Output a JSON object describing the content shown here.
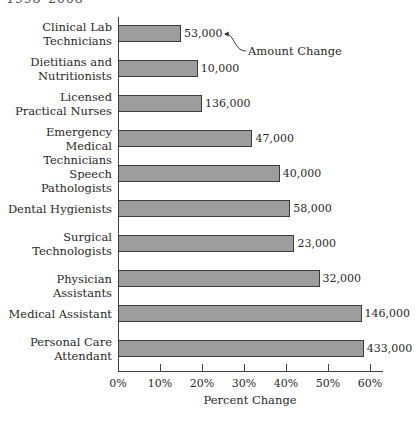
{
  "header": {
    "cropped_title": "1998–2008"
  },
  "chart_data": {
    "type": "bar",
    "orientation": "horizontal",
    "title": "",
    "xlabel": "Percent Change",
    "ylabel": "",
    "xlim": [
      0,
      60
    ],
    "x_ticks": [
      "0%",
      "10%",
      "20%",
      "30%",
      "40%",
      "50%",
      "60%"
    ],
    "grid": false,
    "annotation": "Amount Change",
    "categories": [
      "Clinical Lab Technicians",
      "Dietitians and Nutritionists",
      "Licensed Practical Nurses",
      "Emergency Medical Technicians",
      "Speech Pathologists",
      "Dental Hygienists",
      "Surgical Technologists",
      "Physician Assistants",
      "Medical Assistant",
      "Personal Care Attendant"
    ],
    "category_lines": [
      [
        "Clinical Lab",
        "Technicians"
      ],
      [
        "Dietitians and",
        "Nutritionists"
      ],
      [
        "Licensed",
        "Practical Nurses"
      ],
      [
        "Emergency Medical",
        "Technicians"
      ],
      [
        "Speech Pathologists"
      ],
      [
        "Dental Hygienists"
      ],
      [
        "Surgical",
        "Technologists"
      ],
      [
        "Physician Assistants"
      ],
      [
        "Medical Assistant"
      ],
      [
        "Personal Care",
        "Attendant"
      ]
    ],
    "values": [
      15,
      19,
      20,
      32,
      38.5,
      41,
      42,
      48,
      58,
      58.5
    ],
    "amount_labels": [
      "53,000",
      "10,000",
      "136,000",
      "47,000",
      "40,000",
      "58,000",
      "23,000",
      "32,000",
      "146,000",
      "433,000"
    ],
    "bar_color": "#9d9d9d",
    "bar_border_color": "#3c3c3c"
  }
}
